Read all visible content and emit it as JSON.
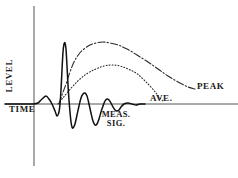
{
  "figure": {
    "title": "",
    "background_color": "#ffffff",
    "ink_color": "#1a1a1a"
  },
  "axes": {
    "y_axis_label": "LEVEL",
    "x_axis_label": "TIME",
    "x_axis_color": "#555555",
    "y_axis_color": "#555555"
  },
  "annotations": {
    "meas_sig_line1": "MEAS.",
    "meas_sig_line2": "SIG.",
    "ave_label": "AVE.",
    "peak_label": "PEAK"
  },
  "chart_data": {
    "type": "line",
    "title": "",
    "xlabel": "TIME",
    "ylabel": "LEVEL",
    "grid": false,
    "legend_position": "inline-annotations",
    "xlim": [
      0,
      238
    ],
    "ylim": [
      0,
      178
    ],
    "baseline_y": 104,
    "y_axis_x": 34,
    "series": [
      {
        "name": "MEAS. SIG.",
        "style": "solid",
        "color": "#101010",
        "width": 1.5,
        "description": "Damped oscillating measurement signal about the time axis",
        "points": [
          [
            5,
            104
          ],
          [
            20,
            104
          ],
          [
            33,
            104
          ],
          [
            38,
            103
          ],
          [
            42,
            99
          ],
          [
            46,
            96
          ],
          [
            49,
            99
          ],
          [
            52,
            104
          ],
          [
            55,
            111
          ],
          [
            57,
            116
          ],
          [
            59,
            112
          ],
          [
            60,
            104
          ],
          [
            61,
            90
          ],
          [
            62,
            70
          ],
          [
            63,
            52
          ],
          [
            64,
            44
          ],
          [
            65,
            43
          ],
          [
            66,
            49
          ],
          [
            67,
            66
          ],
          [
            68,
            85
          ],
          [
            69,
            100
          ],
          [
            70,
            112
          ],
          [
            71,
            122
          ],
          [
            72,
            127
          ],
          [
            73,
            128
          ],
          [
            75,
            124
          ],
          [
            77,
            115
          ],
          [
            79,
            106
          ],
          [
            81,
            98
          ],
          [
            83,
            94
          ],
          [
            85,
            93
          ],
          [
            87,
            96
          ],
          [
            89,
            104
          ],
          [
            91,
            113
          ],
          [
            93,
            121
          ],
          [
            95,
            125
          ],
          [
            97,
            124
          ],
          [
            99,
            119
          ],
          [
            101,
            112
          ],
          [
            103,
            106
          ],
          [
            105,
            101
          ],
          [
            107,
            99
          ],
          [
            109,
            100
          ],
          [
            111,
            103
          ],
          [
            113,
            107
          ],
          [
            115,
            110
          ],
          [
            117,
            111
          ],
          [
            119,
            110
          ],
          [
            121,
            107
          ],
          [
            124,
            104
          ],
          [
            128,
            103
          ],
          [
            132,
            104
          ],
          [
            136,
            105
          ],
          [
            140,
            104
          ],
          [
            145,
            104
          ]
        ]
      },
      {
        "name": "PEAK",
        "style": "dash-dot",
        "color": "#2a2a2a",
        "width": 1.1,
        "description": "Peak detector envelope: fast rise, plateau, slow decay",
        "points": [
          [
            59,
            104
          ],
          [
            62,
            95
          ],
          [
            66,
            84
          ],
          [
            70,
            72
          ],
          [
            74,
            62
          ],
          [
            79,
            54
          ],
          [
            84,
            49
          ],
          [
            90,
            45
          ],
          [
            96,
            43
          ],
          [
            103,
            42
          ],
          [
            110,
            43
          ],
          [
            118,
            45
          ],
          [
            127,
            49
          ],
          [
            137,
            55
          ],
          [
            148,
            62
          ],
          [
            158,
            69
          ],
          [
            168,
            76
          ],
          [
            178,
            82
          ],
          [
            188,
            87
          ],
          [
            195,
            89
          ]
        ]
      },
      {
        "name": "AVE.",
        "style": "dotted",
        "color": "#2a2a2a",
        "width": 1.1,
        "description": "Average detector envelope: slower rise, lower plateau, decay",
        "points": [
          [
            58,
            104
          ],
          [
            62,
            99
          ],
          [
            67,
            93
          ],
          [
            73,
            86
          ],
          [
            80,
            79
          ],
          [
            88,
            73
          ],
          [
            96,
            69
          ],
          [
            104,
            66
          ],
          [
            112,
            65
          ],
          [
            120,
            66
          ],
          [
            128,
            69
          ],
          [
            136,
            73
          ],
          [
            143,
            79
          ],
          [
            150,
            86
          ],
          [
            156,
            93
          ],
          [
            160,
            98
          ],
          [
            163,
            101
          ]
        ]
      }
    ]
  }
}
